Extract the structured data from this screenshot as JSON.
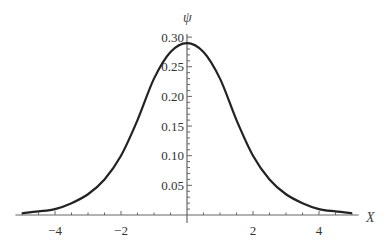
{
  "chart_data": {
    "type": "line",
    "title": "",
    "xlabel": "X",
    "ylabel": "ψ",
    "xlim": [
      -5.2,
      5.2
    ],
    "ylim": [
      0,
      0.3
    ],
    "xticks": [
      -4,
      -2,
      2,
      4
    ],
    "xtick_labels": [
      "−4",
      "−2",
      "2",
      "4"
    ],
    "yticks": [
      0.05,
      0.1,
      0.15,
      0.2,
      0.25,
      0.3
    ],
    "ytick_labels": [
      "0.05",
      "0.10",
      "0.15",
      "0.20",
      "0.25",
      "0.30"
    ],
    "grid": false,
    "legend": null,
    "series": [
      {
        "name": "ψ",
        "color": "#222222",
        "x": [
          -5,
          -4.5,
          -4,
          -3.5,
          -3,
          -2.5,
          -2,
          -1.5,
          -1,
          -0.5,
          0,
          0.5,
          1,
          1.5,
          2,
          2.5,
          3,
          3.5,
          4,
          4.5,
          5
        ],
        "y": [
          0.003,
          0.006,
          0.01,
          0.02,
          0.035,
          0.06,
          0.1,
          0.16,
          0.23,
          0.275,
          0.29,
          0.275,
          0.23,
          0.16,
          0.1,
          0.06,
          0.035,
          0.02,
          0.01,
          0.006,
          0.003
        ]
      }
    ]
  }
}
